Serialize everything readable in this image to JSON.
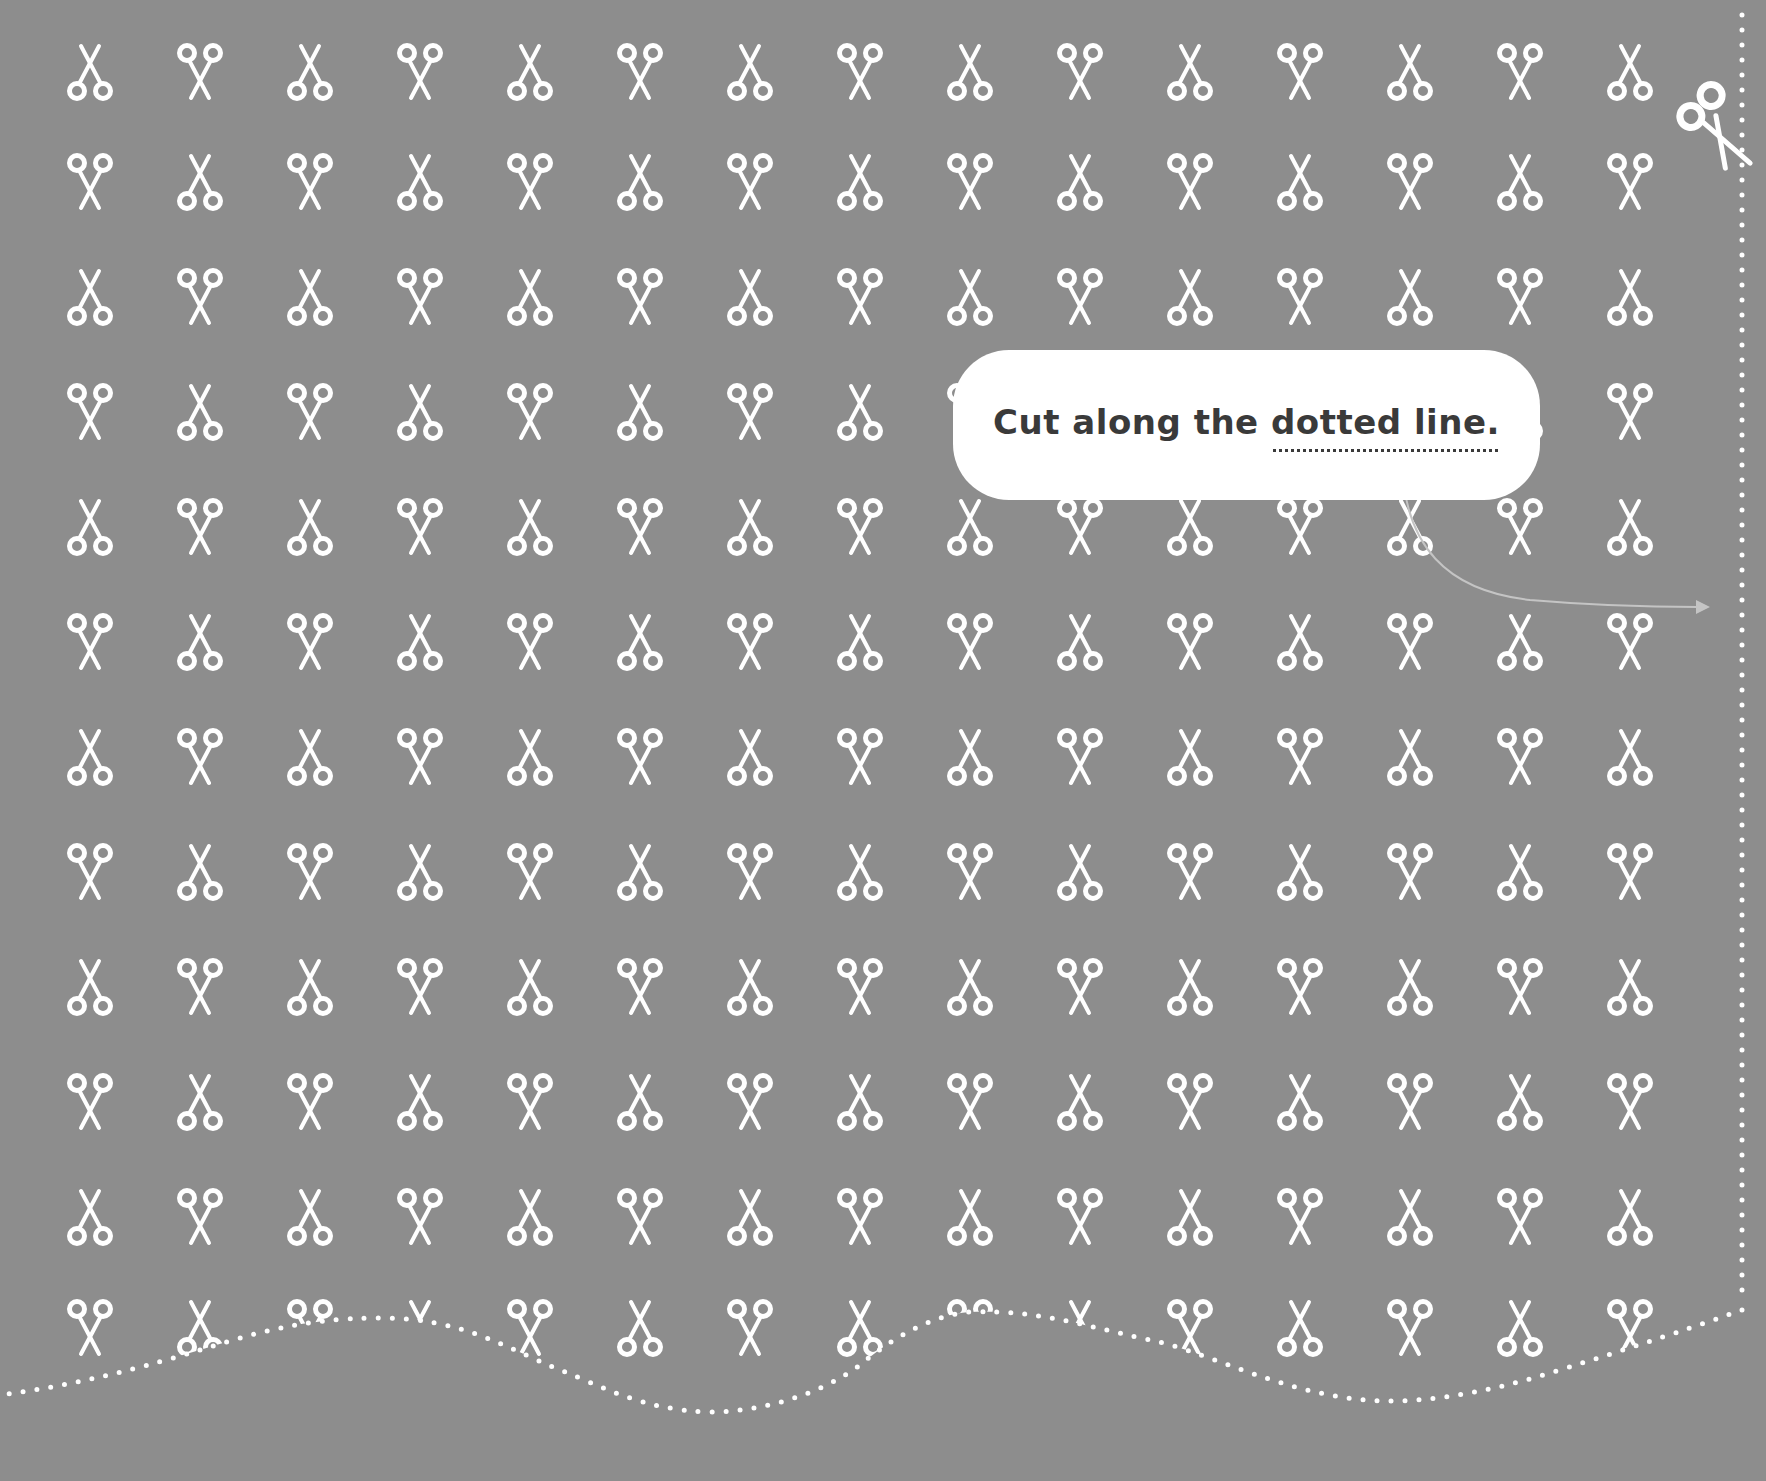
{
  "background_color": "#8d8d8d",
  "pattern_color": "#ffffff",
  "callout": {
    "text_before": "Cut along the ",
    "text_emphasis": "dotted line.",
    "text_color": "#3a3a3a",
    "background": "#ffffff"
  },
  "pattern": {
    "columns_x": [
      90,
      200,
      310,
      420,
      530,
      640,
      750,
      860,
      970,
      1080,
      1190,
      1300,
      1410,
      1520,
      1630
    ],
    "rows_y": [
      72,
      182,
      297,
      412,
      527,
      642,
      757,
      872,
      987,
      1102,
      1217,
      1328
    ],
    "first_row_orientation": "blades-up"
  },
  "cut_line": {
    "icon": "scissors-cutting-icon",
    "start_corner": [
      1700,
      130
    ]
  }
}
